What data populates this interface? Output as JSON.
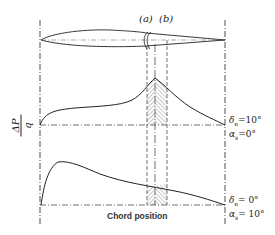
{
  "figure": {
    "type": "airfoil-pressure-distribution-diagram",
    "hinge_labels": {
      "a": "(a)",
      "b": "(b)"
    },
    "y_axis_label": {
      "numerator": "ΔP",
      "denominator": "q"
    },
    "x_axis_label": "Chord position",
    "upper_plot": {
      "condition_1": {
        "symbol": "δ",
        "subscript": "e",
        "value": "=10°"
      },
      "condition_2": {
        "symbol": "α",
        "subscript": "s",
        "value": "=0°"
      }
    },
    "lower_plot": {
      "condition_1": {
        "symbol": "δ",
        "subscript": "e",
        "value": "= 0°"
      },
      "condition_2": {
        "symbol": "α",
        "subscript": "s",
        "value": "= 10°"
      }
    },
    "colors": {
      "line": "#222222",
      "background": "#ffffff"
    }
  }
}
